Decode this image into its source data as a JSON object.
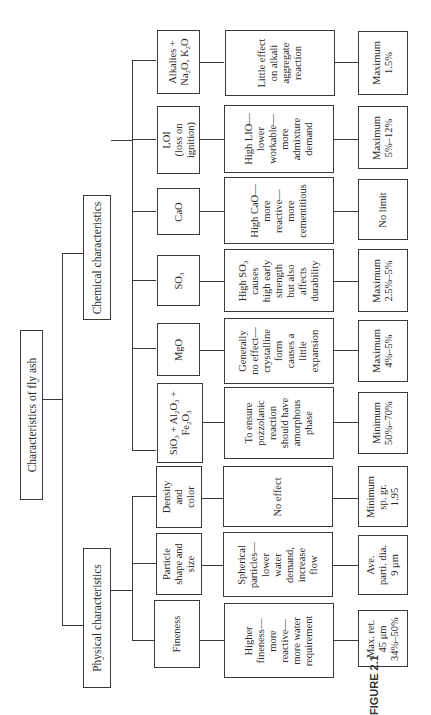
{
  "diagram": {
    "orientation": "rotated-90-ccw",
    "root": {
      "label": "Characteristics of fly ash"
    },
    "branches": [
      {
        "label": "Physical characteristics",
        "properties": [
          {
            "name": [
              "Fineness"
            ],
            "effect": [
              "Higher",
              "fineness—",
              "more",
              "reactive—",
              "more water",
              "requirement"
            ],
            "limit": [
              "Max. ret.",
              "45 μm",
              "34%–50%"
            ]
          },
          {
            "name": [
              "Particle",
              "shape and",
              "size"
            ],
            "effect": [
              "Spherical",
              "particles—",
              "lower",
              "water",
              "demand,",
              "increase",
              "flow"
            ],
            "limit": [
              "Ave.",
              "parti. dia.",
              "9 μm"
            ]
          },
          {
            "name": [
              "Density",
              "and",
              "color"
            ],
            "effect": [
              "No effect"
            ],
            "limit": [
              "Minimum",
              "sp. gr.",
              "1.95"
            ]
          }
        ]
      },
      {
        "label": "Chemical characteristics",
        "properties": [
          {
            "name": [
              "SiO3 + Al2O3 +",
              "Fe2O3"
            ],
            "effect": [
              "To ensure",
              "pozzolanic",
              "reaction",
              "should have",
              "amorphous",
              "phase"
            ],
            "limit": [
              "Minimum",
              "50%–70%"
            ]
          },
          {
            "name": [
              "MgO"
            ],
            "effect": [
              "Generally",
              "no effect—",
              "crystalline",
              "form",
              "causes a",
              "little",
              "expansion"
            ],
            "limit": [
              "Maximum",
              "4%–5%"
            ]
          },
          {
            "name": [
              "SO3"
            ],
            "effect": [
              "High SO3",
              "causes",
              "high early",
              "strength",
              "but also",
              "affects",
              "durability"
            ],
            "limit": [
              "Maximum",
              "2.5%–5%"
            ]
          },
          {
            "name": [
              "CaO"
            ],
            "effect": [
              "High CaO—",
              "more",
              "reactive—",
              "more",
              "cementitious"
            ],
            "limit": [
              "No limit"
            ]
          },
          {
            "name": [
              "LOI",
              "(loss on",
              "ignition)"
            ],
            "effect": [
              "High LIO—",
              "lower",
              "workable—",
              "more",
              "admixture",
              "demand"
            ],
            "limit": [
              "Maximum",
              "5%–12%"
            ]
          },
          {
            "name": [
              "Alkalies +",
              "Na2O, K2O"
            ],
            "effect": [
              "Little effect",
              "on alkali",
              "aggregate",
              "reaction"
            ],
            "limit": [
              "Maximum",
              "1.5%"
            ]
          }
        ]
      }
    ]
  },
  "caption": {
    "label": "FIGURE 2.1"
  }
}
